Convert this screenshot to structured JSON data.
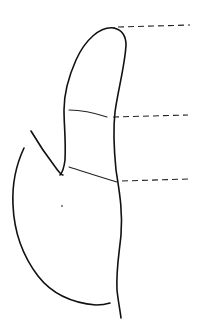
{
  "figure": {
    "stroke_color": "#111111",
    "background": "#ffffff",
    "leaders": [
      {
        "name": "top",
        "y": 27
      },
      {
        "name": "middle",
        "y": 116
      },
      {
        "name": "bottom",
        "y": 179
      }
    ]
  }
}
